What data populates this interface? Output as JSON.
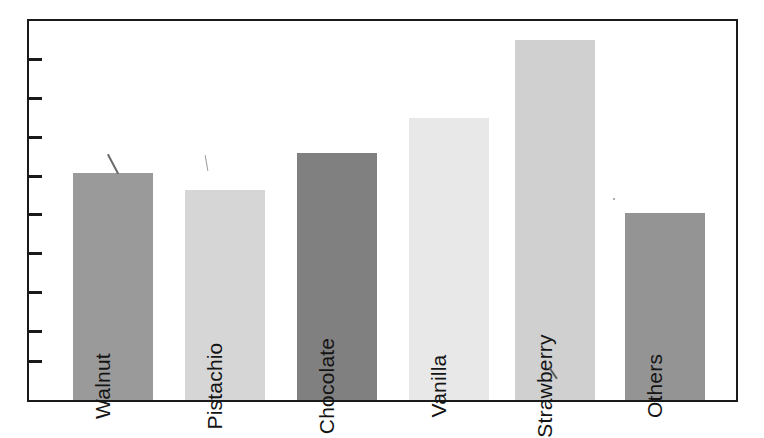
{
  "chart_data": {
    "type": "bar",
    "title": "",
    "subtitle": "",
    "xlabel": "",
    "ylabel": "",
    "categories": [
      "Walnut",
      "Pistachio",
      "Chocolate",
      "Vanilla",
      "Strawberry",
      "Others"
    ],
    "values": [
      229,
      212,
      250,
      285,
      364,
      189
    ],
    "ylim": [
      0,
      383
    ],
    "grid": false,
    "legend": null,
    "axis_tick_labels": [],
    "tick_count": 9,
    "bar_colors": [
      "#9a9a9a",
      "#d6d6d6",
      "#808080",
      "#e8e8e8",
      "#d0d0d0",
      "#949494"
    ],
    "label_placement": "inside-bar-rotated-90",
    "annotations": []
  },
  "figure": {
    "frame_color": "#1a1a1a",
    "background": "#ffffff",
    "tick_color": "#1a1a1a",
    "label_color": "#141414"
  },
  "bars": [
    {
      "name": "Walnut",
      "label": "Walnut",
      "value": 229,
      "color": "#9a9a9a",
      "left": 44,
      "width": 80
    },
    {
      "name": "Pistachio",
      "label": "Pistachio",
      "value": 212,
      "color": "#d6d6d6",
      "left": 156,
      "width": 80
    },
    {
      "name": "Chocolate",
      "label": "Chocolate",
      "value": 250,
      "color": "#808080",
      "left": 268,
      "width": 80
    },
    {
      "name": "Vanilla",
      "label": "Vanilla",
      "value": 285,
      "color": "#e8e8e8",
      "left": 380,
      "width": 80
    },
    {
      "name": "Strawberry",
      "label": "Strawberry",
      "value": 364,
      "color": "#d0d0d0",
      "left": 486,
      "width": 80
    },
    {
      "name": "Others",
      "label": "Others",
      "value": 189,
      "color": "#949494",
      "left": 596,
      "width": 80
    }
  ],
  "y_ticks": [
    39,
    78,
    117,
    156,
    194,
    233,
    272,
    311,
    341
  ]
}
